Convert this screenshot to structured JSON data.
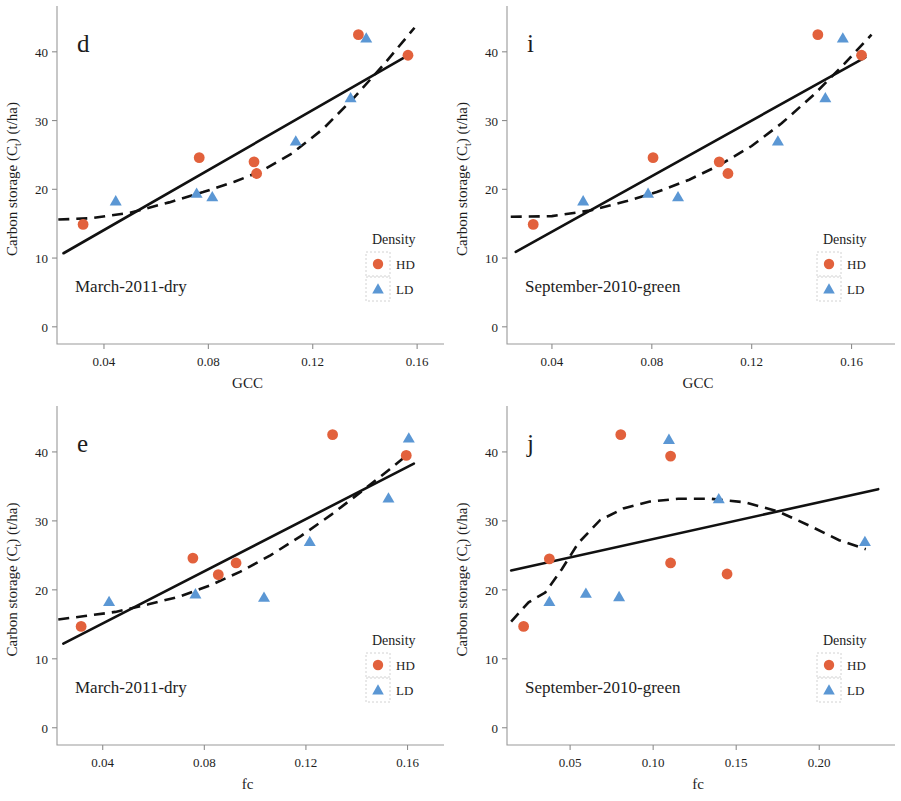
{
  "figure": {
    "background": "#ffffff",
    "marker_colors": {
      "HD": "#e2613c",
      "LD": "#5b97d4"
    },
    "line_color": "#111111"
  },
  "legend": {
    "title": "Density",
    "entries": [
      {
        "label": "HD",
        "marker": "circle",
        "color": "#e2613c"
      },
      {
        "label": "LD",
        "marker": "triangle",
        "color": "#5b97d4"
      }
    ]
  },
  "axis": {
    "ylabel_main": "Carbon storage (C",
    "ylabel_sub": "t",
    "ylabel_tail": ") (t/ha)",
    "yticks": [
      "0",
      "10",
      "20",
      "30",
      "40"
    ]
  },
  "chart_data": [
    {
      "id": "panel-d",
      "type": "scatter",
      "panel_letter": "d",
      "title": "March-2011-dry",
      "xlabel": "GCC",
      "ylabel": "Carbon storage (Ct) (t/ha)",
      "xlim": [
        0.022,
        0.168
      ],
      "ylim": [
        -2.5,
        45.5
      ],
      "xticks": [
        0.04,
        0.08,
        0.12,
        0.16
      ],
      "xtick_labels": [
        "0.04",
        "0.08",
        "0.12",
        "0.16"
      ],
      "yticks": [
        0,
        10,
        20,
        30,
        40
      ],
      "ytick_labels": [
        "0",
        "10",
        "20",
        "30",
        "40"
      ],
      "grid": false,
      "legend_position": "bottom-right",
      "series": [
        {
          "name": "HD",
          "marker": "circle",
          "color": "#e2613c",
          "points": [
            {
              "x": 0.032,
              "y": 14.9
            },
            {
              "x": 0.0765,
              "y": 24.6
            },
            {
              "x": 0.0975,
              "y": 24.0
            },
            {
              "x": 0.0985,
              "y": 22.3
            },
            {
              "x": 0.1375,
              "y": 42.5
            },
            {
              "x": 0.1565,
              "y": 39.5
            }
          ]
        },
        {
          "name": "LD",
          "marker": "triangle",
          "color": "#5b97d4",
          "points": [
            {
              "x": 0.0445,
              "y": 18.3
            },
            {
              "x": 0.0755,
              "y": 19.4
            },
            {
              "x": 0.0815,
              "y": 18.9
            },
            {
              "x": 0.1135,
              "y": 27.0
            },
            {
              "x": 0.1345,
              "y": 33.3
            },
            {
              "x": 0.1405,
              "y": 42.0
            }
          ]
        }
      ],
      "fit_linear": {
        "x0": 0.0245,
        "y0": 10.7,
        "x1": 0.1575,
        "y1": 39.7
      },
      "fit_smooth": [
        {
          "x": 0.0225,
          "y": 15.6
        },
        {
          "x": 0.035,
          "y": 15.8
        },
        {
          "x": 0.05,
          "y": 16.6
        },
        {
          "x": 0.065,
          "y": 18.1
        },
        {
          "x": 0.078,
          "y": 19.6
        },
        {
          "x": 0.09,
          "y": 21.1
        },
        {
          "x": 0.1,
          "y": 22.6
        },
        {
          "x": 0.112,
          "y": 25.2
        },
        {
          "x": 0.124,
          "y": 28.8
        },
        {
          "x": 0.136,
          "y": 33.4
        },
        {
          "x": 0.148,
          "y": 38.5
        },
        {
          "x": 0.159,
          "y": 43.5
        }
      ]
    },
    {
      "id": "panel-i",
      "type": "scatter",
      "panel_letter": "i",
      "title": "September-2010-green",
      "xlabel": "GCC",
      "ylabel": "Carbon storage (Ct) (t/ha)",
      "xlim": [
        0.022,
        0.175
      ],
      "ylim": [
        -2.5,
        45.5
      ],
      "xticks": [
        0.04,
        0.08,
        0.12,
        0.16
      ],
      "xtick_labels": [
        "0.04",
        "0.08",
        "0.12",
        "0.16"
      ],
      "yticks": [
        0,
        10,
        20,
        30,
        40
      ],
      "ytick_labels": [
        "0",
        "10",
        "20",
        "30",
        "40"
      ],
      "grid": false,
      "legend_position": "bottom-right",
      "series": [
        {
          "name": "HD",
          "marker": "circle",
          "color": "#e2613c",
          "points": [
            {
              "x": 0.0325,
              "y": 14.9
            },
            {
              "x": 0.0805,
              "y": 24.6
            },
            {
              "x": 0.107,
              "y": 24.0
            },
            {
              "x": 0.1105,
              "y": 22.3
            },
            {
              "x": 0.1465,
              "y": 42.5
            },
            {
              "x": 0.164,
              "y": 39.5
            }
          ]
        },
        {
          "name": "LD",
          "marker": "triangle",
          "color": "#5b97d4",
          "points": [
            {
              "x": 0.0525,
              "y": 18.3
            },
            {
              "x": 0.0785,
              "y": 19.4
            },
            {
              "x": 0.0905,
              "y": 18.9
            },
            {
              "x": 0.1305,
              "y": 27.0
            },
            {
              "x": 0.1495,
              "y": 33.3
            },
            {
              "x": 0.1565,
              "y": 42.0
            }
          ]
        }
      ],
      "fit_linear": {
        "x0": 0.0255,
        "y0": 10.9,
        "x1": 0.1655,
        "y1": 39.2
      },
      "fit_smooth": [
        {
          "x": 0.0235,
          "y": 16.0
        },
        {
          "x": 0.04,
          "y": 16.1
        },
        {
          "x": 0.055,
          "y": 16.9
        },
        {
          "x": 0.07,
          "y": 18.3
        },
        {
          "x": 0.082,
          "y": 19.6
        },
        {
          "x": 0.095,
          "y": 21.4
        },
        {
          "x": 0.107,
          "y": 23.5
        },
        {
          "x": 0.12,
          "y": 26.3
        },
        {
          "x": 0.132,
          "y": 29.6
        },
        {
          "x": 0.145,
          "y": 33.8
        },
        {
          "x": 0.157,
          "y": 38.2
        },
        {
          "x": 0.168,
          "y": 42.5
        }
      ]
    },
    {
      "id": "panel-e",
      "type": "scatter",
      "panel_letter": "e",
      "title": "March-2011-dry",
      "xlabel": "fc",
      "ylabel": "Carbon storage (Ct) (t/ha)",
      "xlim": [
        0.022,
        0.172
      ],
      "ylim": [
        -2.5,
        45.5
      ],
      "xticks": [
        0.04,
        0.08,
        0.12,
        0.16
      ],
      "xtick_labels": [
        "0.04",
        "0.08",
        "0.12",
        "0.16"
      ],
      "yticks": [
        0,
        10,
        20,
        30,
        40
      ],
      "ytick_labels": [
        "0",
        "10",
        "20",
        "30",
        "40"
      ],
      "grid": false,
      "legend_position": "bottom-right",
      "series": [
        {
          "name": "HD",
          "marker": "circle",
          "color": "#e2613c",
          "points": [
            {
              "x": 0.0315,
              "y": 14.7
            },
            {
              "x": 0.0755,
              "y": 24.6
            },
            {
              "x": 0.0855,
              "y": 22.2
            },
            {
              "x": 0.0925,
              "y": 23.9
            },
            {
              "x": 0.1305,
              "y": 42.5
            },
            {
              "x": 0.1595,
              "y": 39.5
            }
          ]
        },
        {
          "name": "LD",
          "marker": "triangle",
          "color": "#5b97d4",
          "points": [
            {
              "x": 0.0425,
              "y": 18.3
            },
            {
              "x": 0.0765,
              "y": 19.4
            },
            {
              "x": 0.1035,
              "y": 18.9
            },
            {
              "x": 0.1215,
              "y": 27.0
            },
            {
              "x": 0.1525,
              "y": 33.3
            },
            {
              "x": 0.1605,
              "y": 42.0
            }
          ]
        }
      ],
      "fit_linear": {
        "x0": 0.0245,
        "y0": 12.2,
        "x1": 0.1625,
        "y1": 38.3
      },
      "fit_smooth": [
        {
          "x": 0.0225,
          "y": 15.7
        },
        {
          "x": 0.033,
          "y": 16.2
        },
        {
          "x": 0.045,
          "y": 16.8
        },
        {
          "x": 0.058,
          "y": 17.9
        },
        {
          "x": 0.07,
          "y": 19.0
        },
        {
          "x": 0.082,
          "y": 20.6
        },
        {
          "x": 0.094,
          "y": 22.6
        },
        {
          "x": 0.106,
          "y": 25.0
        },
        {
          "x": 0.118,
          "y": 27.8
        },
        {
          "x": 0.13,
          "y": 30.9
        },
        {
          "x": 0.142,
          "y": 34.3
        },
        {
          "x": 0.153,
          "y": 37.5
        },
        {
          "x": 0.161,
          "y": 39.9
        }
      ]
    },
    {
      "id": "panel-j",
      "type": "scatter",
      "panel_letter": "j",
      "title": "September-2010-green",
      "xlabel": "fc",
      "ylabel": "Carbon storage (Ct) (t/ha)",
      "xlim": [
        0.012,
        0.242
      ],
      "ylim": [
        -2.5,
        45.5
      ],
      "xticks": [
        0.05,
        0.1,
        0.15,
        0.2
      ],
      "xtick_labels": [
        "0.05",
        "0.10",
        "0.15",
        "0.20"
      ],
      "yticks": [
        0,
        10,
        20,
        30,
        40
      ],
      "ytick_labels": [
        "0",
        "10",
        "20",
        "30",
        "40"
      ],
      "grid": false,
      "legend_position": "bottom-right",
      "series": [
        {
          "name": "HD",
          "marker": "circle",
          "color": "#e2613c",
          "points": [
            {
              "x": 0.022,
              "y": 14.7
            },
            {
              "x": 0.0375,
              "y": 24.5
            },
            {
              "x": 0.0805,
              "y": 42.5
            },
            {
              "x": 0.1105,
              "y": 39.4
            },
            {
              "x": 0.1105,
              "y": 23.9
            },
            {
              "x": 0.1445,
              "y": 22.3
            }
          ]
        },
        {
          "name": "LD",
          "marker": "triangle",
          "color": "#5b97d4",
          "points": [
            {
              "x": 0.0375,
              "y": 18.3
            },
            {
              "x": 0.0595,
              "y": 19.5
            },
            {
              "x": 0.0795,
              "y": 19.0
            },
            {
              "x": 0.1095,
              "y": 41.8
            },
            {
              "x": 0.1395,
              "y": 33.2
            },
            {
              "x": 0.2275,
              "y": 27.0
            }
          ]
        }
      ],
      "fit_linear": {
        "x0": 0.0145,
        "y0": 22.8,
        "x1": 0.2355,
        "y1": 34.6
      },
      "fit_smooth": [
        {
          "x": 0.0145,
          "y": 15.4
        },
        {
          "x": 0.025,
          "y": 18.2
        },
        {
          "x": 0.035,
          "y": 19.6
        },
        {
          "x": 0.045,
          "y": 23.0
        },
        {
          "x": 0.055,
          "y": 26.8
        },
        {
          "x": 0.068,
          "y": 30.1
        },
        {
          "x": 0.082,
          "y": 31.8
        },
        {
          "x": 0.098,
          "y": 32.8
        },
        {
          "x": 0.115,
          "y": 33.2
        },
        {
          "x": 0.135,
          "y": 33.2
        },
        {
          "x": 0.155,
          "y": 32.7
        },
        {
          "x": 0.175,
          "y": 31.4
        },
        {
          "x": 0.195,
          "y": 29.2
        },
        {
          "x": 0.212,
          "y": 27.2
        },
        {
          "x": 0.228,
          "y": 25.9
        }
      ]
    }
  ]
}
